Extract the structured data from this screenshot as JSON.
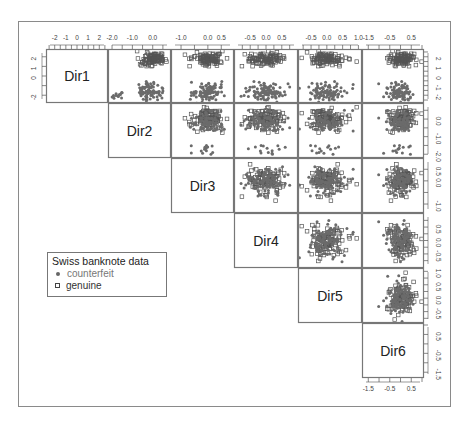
{
  "chart_data": {
    "type": "scatter",
    "title": "",
    "subtitle": "",
    "layout": "scatterplot-matrix-upper-triangle",
    "variables": [
      "Dir1",
      "Dir2",
      "Dir3",
      "Dir4",
      "Dir5",
      "Dir6"
    ],
    "axis_ticks": {
      "Dir1": {
        "labels": [
          "-2",
          "-1",
          "0",
          "1",
          "2"
        ],
        "values": [
          -2,
          -1,
          0,
          1,
          2
        ],
        "range": [
          -2.6,
          2.6
        ]
      },
      "Dir2": {
        "labels": [
          "-2.0",
          "-1.0",
          "0.0"
        ],
        "values": [
          -2.0,
          -1.0,
          0.0
        ],
        "range": [
          -2.1,
          0.8
        ]
      },
      "Dir3": {
        "labels": [
          "-1.0",
          "0.0",
          "0.5"
        ],
        "values": [
          -1.0,
          0.0,
          0.5
        ],
        "range": [
          -1.3,
          0.9
        ]
      },
      "Dir4": {
        "labels": [
          "-0.5",
          "0.0",
          "0.5"
        ],
        "values": [
          -0.5,
          0.0,
          0.5
        ],
        "range": [
          -0.95,
          0.95
        ]
      },
      "Dir5": {
        "labels": [
          "-0.5",
          "0.0",
          "0.5",
          "1.0"
        ],
        "values": [
          -0.5,
          0.0,
          0.5,
          1.0
        ],
        "range": [
          -0.85,
          1.05
        ]
      },
      "Dir6": {
        "labels": [
          "-1.5",
          "-0.5",
          "0.5"
        ],
        "values": [
          -1.5,
          -0.5,
          0.5
        ],
        "range": [
          -1.7,
          1.0
        ]
      }
    },
    "top_axis_labels": [
      {
        "column": "Dir1",
        "text": "-2 -1 0 1 2"
      },
      {
        "column": "Dir2",
        "text": "-2.0 -1.0 0.0"
      },
      {
        "column": "Dir3",
        "text": "-1.0 0.0 0.5"
      },
      {
        "column": "Dir4",
        "text": "-0.5 0.0 0.5"
      },
      {
        "column": "Dir5",
        "text": "-0.5 0.0 0.5 1.0"
      },
      {
        "column": "Dir6",
        "text": "-1.5 -0.5 0.5"
      }
    ],
    "right_axis_labels": [
      {
        "row": "Dir1",
        "text": "-2 0 1 2"
      },
      {
        "row": "Dir2",
        "text": "-2.0 -1.0 0.0"
      },
      {
        "row": "Dir3",
        "text": "-1.0 0.0"
      },
      {
        "row": "Dir4",
        "text": "-0.5 0.0 0.5"
      },
      {
        "row": "Dir5",
        "text": "-0.5 0.5"
      },
      {
        "row": "Dir6",
        "text": "-1.5 -0.5 0.5"
      }
    ],
    "bottom_axis_labels": {
      "column": "Dir6",
      "labels": [
        "-1.5",
        "-0.5",
        "0.5"
      ]
    },
    "left_axis_labels": {
      "row": "Dir1",
      "labels": [
        "-2",
        "0",
        "1",
        "2"
      ]
    },
    "groups": [
      {
        "name": "counterfeit",
        "marker": "filled-circle",
        "color": "#666666",
        "approx_centers": {
          "Dir1": -1.7,
          "Dir2": -0.2,
          "Dir3": 0.0,
          "Dir4": 0.0,
          "Dir5": 0.0,
          "Dir6": 0.0
        },
        "approx_sd": {
          "Dir1": 0.5,
          "Dir2": 0.3,
          "Dir3": 0.3,
          "Dir4": 0.3,
          "Dir5": 0.3,
          "Dir6": 0.3
        },
        "note": "upper cluster in Dir1 rows; small outlier group near Dir2 = -1.8"
      },
      {
        "name": "genuine",
        "marker": "open-square",
        "color": "#444444",
        "approx_centers": {
          "Dir1": 1.8,
          "Dir2": 0.0,
          "Dir3": 0.0,
          "Dir4": 0.0,
          "Dir5": 0.0,
          "Dir6": 0.0
        },
        "approx_sd": {
          "Dir1": 0.35,
          "Dir2": 0.3,
          "Dir3": 0.3,
          "Dir4": 0.3,
          "Dir5": 0.3,
          "Dir6": 0.3
        }
      }
    ],
    "n_points_per_group": 100,
    "grid": false,
    "legend": {
      "position": "lower-left (empty lower triangle)",
      "title": "Swiss banknote data",
      "entries": [
        "counterfeit",
        "genuine"
      ]
    },
    "xlabel": "",
    "ylabel": ""
  },
  "legend": {
    "title": "Swiss banknote data",
    "items": [
      {
        "label": "counterfeit",
        "marker": "dot"
      },
      {
        "label": "genuine",
        "marker": "square"
      }
    ]
  },
  "diagonal_labels": [
    "Dir1",
    "Dir2",
    "Dir3",
    "Dir4",
    "Dir5",
    "Dir6"
  ]
}
